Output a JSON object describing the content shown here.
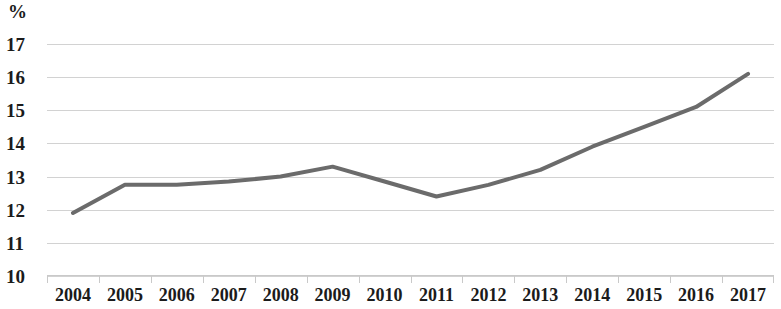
{
  "chart_data": {
    "type": "line",
    "title": "",
    "subtitle": "",
    "xlabel": "",
    "ylabel": "%",
    "unit_caption": "%",
    "categories": [
      "2004",
      "2005",
      "2006",
      "2007",
      "2008",
      "2009",
      "2010",
      "2011",
      "2012",
      "2013",
      "2014",
      "2015",
      "2016",
      "2017"
    ],
    "values": [
      11.9,
      12.75,
      12.75,
      12.85,
      13.0,
      13.3,
      12.85,
      12.4,
      12.75,
      13.2,
      13.9,
      14.5,
      15.1,
      16.1
    ],
    "series": [
      {
        "name": "",
        "values": [
          11.9,
          12.75,
          12.75,
          12.85,
          13.0,
          13.3,
          12.85,
          12.4,
          12.75,
          13.2,
          13.9,
          14.5,
          15.1,
          16.1
        ]
      }
    ],
    "ylim": [
      10,
      17
    ],
    "yticks": [
      17,
      16,
      15,
      14,
      13,
      12,
      11,
      10
    ],
    "ytick_labels": [
      "17",
      "16",
      "15",
      "14",
      "13",
      "12",
      "11",
      "10"
    ],
    "grid": true,
    "grid_axis": "y",
    "legend": false,
    "legend_position": "none",
    "markers": false,
    "line_color": "#6b6b6b",
    "line_width": 4,
    "grid_color": "#d2d2d2",
    "axis_color": "#c9c9c9",
    "text_color": "#1b1b1b",
    "background_color": "#ffffff"
  }
}
